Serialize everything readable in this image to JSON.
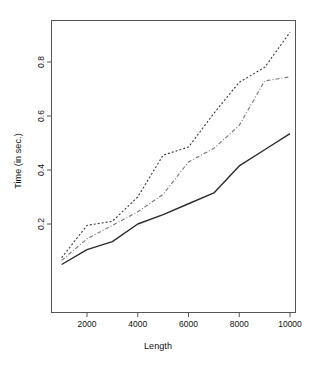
{
  "chart_data": {
    "type": "line",
    "title": "",
    "xlabel": "Length",
    "ylabel": "Time (in sec.)",
    "xlim": [
      1000,
      10000
    ],
    "ylim": [
      0.04,
      0.92
    ],
    "xticks": [
      2000,
      4000,
      6000,
      8000,
      10000
    ],
    "xtick_labels": [
      "2000",
      "4000",
      "6000",
      "8000",
      "10000"
    ],
    "yticks": [
      0.2,
      0.4,
      0.6,
      0.8
    ],
    "ytick_labels": [
      "0.2",
      "0.4",
      "0.6",
      "0.8"
    ],
    "grid": false,
    "legend": "none",
    "box": true,
    "x": [
      1000,
      2000,
      3000,
      4000,
      5000,
      6000,
      7000,
      8000,
      9000,
      10000
    ],
    "series": [
      {
        "name": "series-solid",
        "style": "solid",
        "color": "#2b2b2b",
        "values": [
          0.05,
          0.105,
          0.135,
          0.2,
          0.235,
          0.275,
          0.315,
          0.415,
          0.475,
          0.535
        ]
      },
      {
        "name": "series-dotted",
        "style": "dotted",
        "color": "#3a3a3a",
        "values": [
          0.075,
          0.195,
          0.21,
          0.3,
          0.455,
          0.485,
          0.61,
          0.725,
          0.78,
          0.91
        ]
      },
      {
        "name": "series-dashdot",
        "style": "dashdot",
        "color": "#777777",
        "values": [
          0.065,
          0.145,
          0.195,
          0.245,
          0.31,
          0.43,
          0.48,
          0.565,
          0.73,
          0.745
        ]
      }
    ]
  },
  "axes": {
    "plot_box": {
      "left": 51,
      "top": 20,
      "right": 296,
      "bottom": 313
    }
  }
}
